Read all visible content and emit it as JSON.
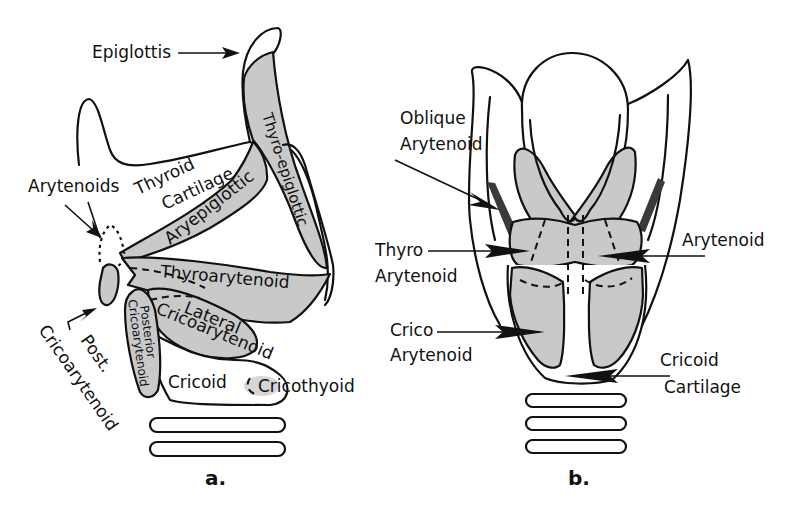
{
  "figure": {
    "panels": [
      {
        "id": "a",
        "label": "a.",
        "view": "lateral",
        "labels": {
          "epiglottis": "Epiglottis",
          "arytenoids": "Arytenoids",
          "thyroid": "Thyroid",
          "cartilage": "Cartilage",
          "aryepiglottic": "Aryepiglottic",
          "thyro_epiglottic": "Thyro-epiglottic",
          "thyroarytenoid": "Thyroarytenoid",
          "lateral": "Lateral",
          "cricoarytenoid": "Cricoarytenoid",
          "posterior": "Posterior",
          "posterior_cricoarytenoid": "Cricoarytenoid",
          "post": "Post.",
          "post_cricoarytenoid": "Cricoarytenoid",
          "cricoid": "Cricoid",
          "cricothyoid": "Cricothyoid"
        }
      },
      {
        "id": "b",
        "label": "b.",
        "view": "posterior",
        "labels": {
          "oblique": "Oblique",
          "oblique_arytenoid": "Arytenoid",
          "thyro": "Thyro",
          "thyro_arytenoid": "Arytenoid",
          "crico": "Crico",
          "crico_arytenoid": "Arytenoid",
          "arytenoid": "Arytenoid",
          "cricoid": "Cricoid",
          "cricoid_cartilage": "Cartilage"
        }
      }
    ],
    "colors": {
      "muscle_fill": "#c9c9c9",
      "dark_muscle": "#3a3a3a",
      "outline": "#111111",
      "background": "#ffffff"
    }
  }
}
